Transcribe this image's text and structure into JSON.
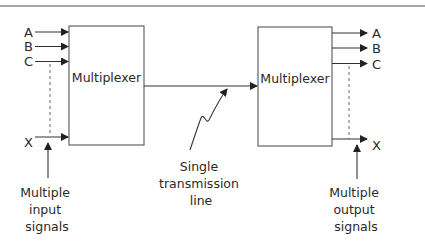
{
  "diagram": {
    "left_mux": {
      "label": "Multiplexer",
      "inputs": [
        "A",
        "B",
        "C",
        "X"
      ]
    },
    "right_mux": {
      "label": "Multiplexer",
      "outputs": [
        "A",
        "B",
        "C",
        "X"
      ]
    },
    "link_label": [
      "Single",
      "transmission",
      "line"
    ],
    "input_caption": [
      "Multiple",
      "input",
      "signals"
    ],
    "output_caption": [
      "Multiple",
      "output",
      "signals"
    ],
    "colors": {
      "line": "#333333",
      "box_border": "#555555",
      "rule": "#8a8a8a",
      "text": "#2a2a2a"
    }
  }
}
